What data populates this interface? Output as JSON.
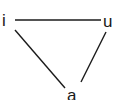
{
  "diagram": {
    "type": "vowel-triangle",
    "nodes": [
      {
        "id": "i",
        "label": "i"
      },
      {
        "id": "u",
        "label": "u"
      },
      {
        "id": "a",
        "label": "a"
      }
    ],
    "edges": [
      {
        "from": "i",
        "to": "u"
      },
      {
        "from": "i",
        "to": "a"
      },
      {
        "from": "u",
        "to": "a"
      }
    ],
    "line_color": "#1a1a1a"
  }
}
